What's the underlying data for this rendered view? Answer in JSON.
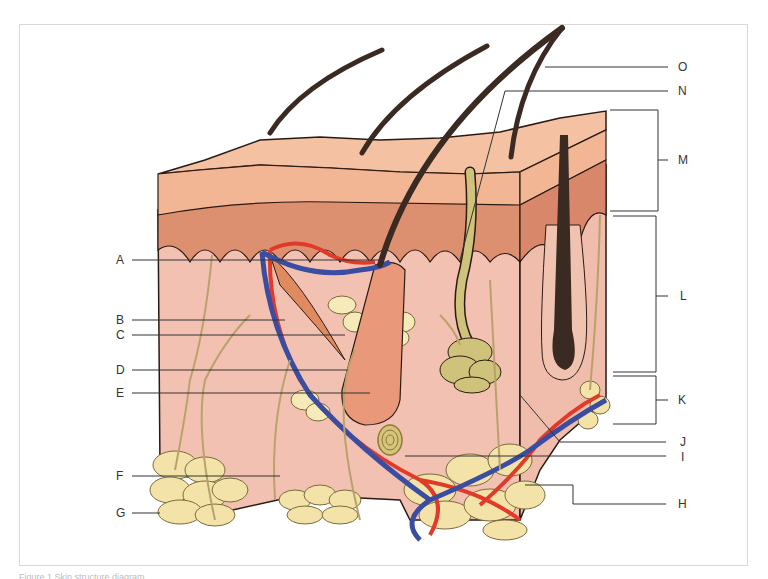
{
  "figure": {
    "caption": "Figure 1 Skin structure diagram"
  },
  "labels_left": [
    {
      "letter": "A"
    },
    {
      "letter": "B"
    },
    {
      "letter": "C"
    },
    {
      "letter": "D"
    },
    {
      "letter": "E"
    },
    {
      "letter": "F"
    },
    {
      "letter": "G"
    }
  ],
  "labels_right": [
    {
      "letter": "O"
    },
    {
      "letter": "N"
    },
    {
      "letter": "M"
    },
    {
      "letter": "L"
    },
    {
      "letter": "K"
    },
    {
      "letter": "J"
    },
    {
      "letter": "I"
    },
    {
      "letter": "H"
    }
  ],
  "colors": {
    "epidermis": "#f2b695",
    "papillary": "#dd9070",
    "dermis": "#f3c1b2",
    "hypodermis_fat": "#f3e3a8",
    "artery": "#e23a28",
    "vein": "#3b4da0",
    "nerve": "#b8a26a",
    "hair": "#3a2a22",
    "sweat_gland": "#cfc27a",
    "arrector_muscle": "#e08a60",
    "follicle": "#e9987a",
    "outline": "#2a1a14",
    "leader_line": "#333333"
  }
}
